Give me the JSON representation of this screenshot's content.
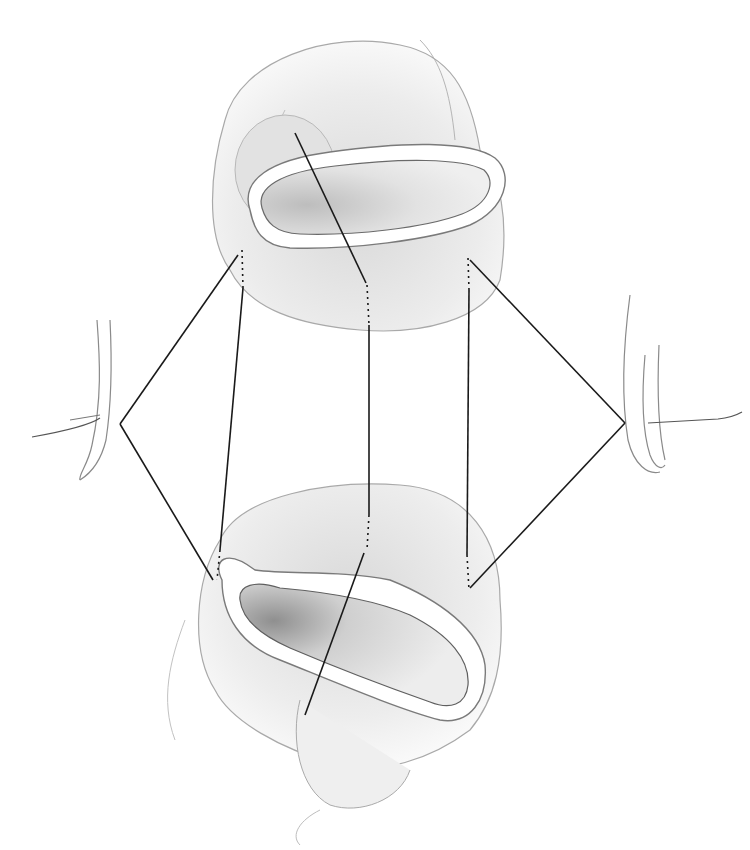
{
  "figure": {
    "type": "surgical-illustration",
    "background_color": "#ffffff",
    "line_color": "#1a1a1a",
    "tissue_outline_color": "#9a9a9a",
    "tissue_fill_color": "#ececec",
    "lumen_fill_color": "#c8c8c8",
    "labels": []
  }
}
